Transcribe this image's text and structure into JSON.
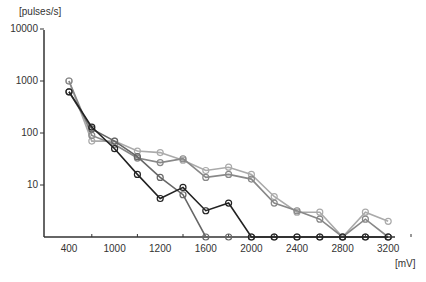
{
  "chart_data": {
    "type": "line",
    "title": "",
    "xlabel": "[mV]",
    "ylabel": "[pulses/s]",
    "yscale": "log",
    "ylim": [
      1,
      10000
    ],
    "grid": false,
    "legend": null,
    "y_ticks": [
      "10000",
      "1000",
      "100",
      "10"
    ],
    "x_tick_labels": [
      "400",
      "1000",
      "1200",
      "1600",
      "2000",
      "2400",
      "2800",
      "3200"
    ],
    "x": [
      400,
      600,
      800,
      1000,
      1200,
      1400,
      1600,
      1800,
      2000,
      2200,
      2400,
      2600,
      2800,
      3000,
      3200
    ],
    "series": [
      {
        "name": "series-1",
        "color": "#aaaaaa",
        "values": [
          1000,
          70,
          70,
          45,
          42,
          30,
          19,
          22,
          16,
          6,
          3,
          3,
          1,
          3,
          2
        ]
      },
      {
        "name": "series-2",
        "color": "#888888",
        "values": [
          1000,
          90,
          60,
          33,
          27,
          32,
          14,
          16,
          13,
          4.5,
          3.2,
          2.2,
          1,
          2.2,
          1
        ]
      },
      {
        "name": "series-3",
        "color": "#666666",
        "values": [
          620,
          120,
          70,
          35,
          14,
          6.5,
          1,
          1,
          1,
          1,
          1,
          1,
          1,
          1,
          1
        ]
      },
      {
        "name": "series-4",
        "color": "#222222",
        "values": [
          620,
          130,
          50,
          16,
          5.5,
          9,
          3.2,
          4.5,
          1,
          1,
          1,
          1,
          1,
          1,
          1
        ]
      }
    ]
  },
  "axes": {
    "y_title": "[pulses/s]",
    "x_title": "[mV]"
  }
}
